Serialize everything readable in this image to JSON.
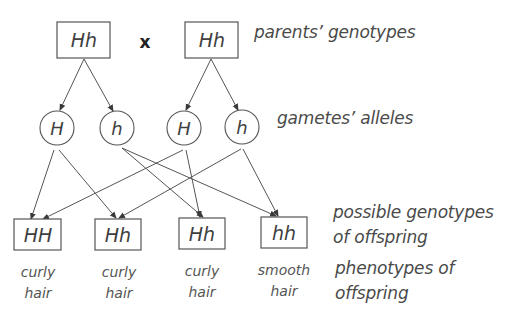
{
  "parents": {
    "left": {
      "genotype": "Hh"
    },
    "cross_symbol": "x",
    "right": {
      "genotype": "Hh"
    },
    "row_label": "parents’ genotypes"
  },
  "gametes": {
    "items": [
      {
        "allele": "H",
        "from": "left-parent"
      },
      {
        "allele": "h",
        "from": "left-parent"
      },
      {
        "allele": "H",
        "from": "right-parent"
      },
      {
        "allele": "h",
        "from": "right-parent"
      }
    ],
    "row_label": "gametes’ alleles"
  },
  "offspring": {
    "genotypes": [
      "HH",
      "Hh",
      "Hh",
      "hh"
    ],
    "genotype_label_line1": "possible genotypes",
    "genotype_label_line2": "of offspring",
    "phenotypes": [
      {
        "line1": "curly",
        "line2": "hair"
      },
      {
        "line1": "curly",
        "line2": "hair"
      },
      {
        "line1": "curly",
        "line2": "hair"
      },
      {
        "line1": "smooth",
        "line2": "hair"
      }
    ],
    "phenotype_label_line1": "phenotypes of",
    "phenotype_label_line2": "offspring"
  },
  "connections": [
    {
      "from": "parent-left",
      "to": "gamete-H-left"
    },
    {
      "from": "parent-left",
      "to": "gamete-h-left"
    },
    {
      "from": "parent-right",
      "to": "gamete-H-right"
    },
    {
      "from": "parent-right",
      "to": "gamete-h-right"
    },
    {
      "from": "gamete-H-left",
      "to": "offspring-HH"
    },
    {
      "from": "gamete-H-left",
      "to": "offspring-Hh-1"
    },
    {
      "from": "gamete-h-left",
      "to": "offspring-Hh-2"
    },
    {
      "from": "gamete-h-left",
      "to": "offspring-hh"
    },
    {
      "from": "gamete-H-right",
      "to": "offspring-HH"
    },
    {
      "from": "gamete-H-right",
      "to": "offspring-Hh-2"
    },
    {
      "from": "gamete-h-right",
      "to": "offspring-Hh-1"
    },
    {
      "from": "gamete-h-right",
      "to": "offspring-hh"
    }
  ],
  "colors": {
    "stroke": "#555555",
    "text": "#3f3f3f",
    "background": "#ffffff"
  }
}
